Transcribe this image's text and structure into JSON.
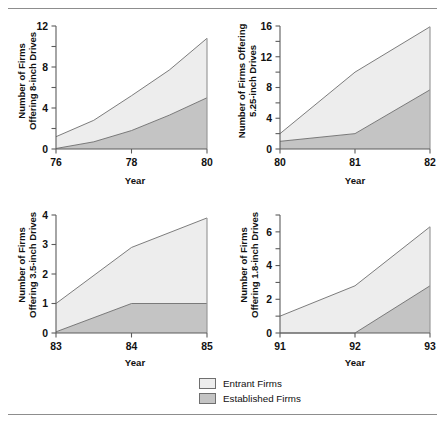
{
  "figure": {
    "background": "#ffffff",
    "rule_color": "#8d8d8d"
  },
  "legend": {
    "items": [
      {
        "label": "Entrant Firms",
        "color": "#ededed",
        "key": "entrant"
      },
      {
        "label": "Established Firms",
        "color": "#c4c4c4",
        "key": "established"
      }
    ]
  },
  "colors": {
    "entrant_fill": "#ededed",
    "established_fill": "#c4c4c4",
    "line": "#6e6e6e",
    "axis": "#5c5c5c",
    "text": "#111111"
  },
  "chart_data": [
    {
      "id": "panel-8-inch",
      "type": "area",
      "stacked": true,
      "title": "",
      "ylabel": "Number of Firms Offering 8-inch Drives",
      "ylabel_lines": [
        "Number of Firms",
        "Offering 8-inch Drives"
      ],
      "xlabel": "Year",
      "x": [
        76,
        77,
        78,
        79,
        80
      ],
      "xlim": [
        76,
        80
      ],
      "ylim": [
        0,
        12
      ],
      "xticks": [
        76,
        78,
        80
      ],
      "xticklabels": [
        "76",
        "78",
        "80"
      ],
      "yticks": [
        0,
        2,
        4,
        6,
        8,
        10,
        12
      ],
      "yticklabels": [
        "0",
        "",
        "4",
        "",
        "8",
        "",
        "12"
      ],
      "grid": false,
      "legend_position": "figure-bottom",
      "series": [
        {
          "name": "Established Firms",
          "key": "established",
          "values": [
            0.05,
            0.7,
            1.8,
            3.3,
            5.0
          ]
        },
        {
          "name": "Entrant Firms",
          "key": "entrant",
          "values": [
            1.15,
            2.1,
            3.4,
            4.4,
            5.8
          ]
        }
      ],
      "totals": [
        1.2,
        2.8,
        5.2,
        7.7,
        10.8
      ]
    },
    {
      "id": "panel-5-25-inch",
      "type": "area",
      "stacked": true,
      "title": "",
      "ylabel": "Number of Firms Offering 5.25-inch Drives",
      "ylabel_lines": [
        "Number of Firms Offering",
        "5.25-inch Drives"
      ],
      "xlabel": "Year",
      "x": [
        80,
        81,
        82
      ],
      "xlim": [
        80,
        82
      ],
      "ylim": [
        0,
        16
      ],
      "xticks": [
        80,
        81,
        82
      ],
      "xticklabels": [
        "80",
        "81",
        "82"
      ],
      "yticks": [
        0,
        2,
        4,
        6,
        8,
        10,
        12,
        14,
        16
      ],
      "yticklabels": [
        "0",
        "",
        "4",
        "",
        "8",
        "",
        "12",
        "",
        "16"
      ],
      "grid": false,
      "legend_position": "figure-bottom",
      "series": [
        {
          "name": "Established Firms",
          "key": "established",
          "values": [
            1.0,
            2.0,
            7.7
          ]
        },
        {
          "name": "Entrant Firms",
          "key": "entrant",
          "values": [
            1.0,
            8.0,
            8.2
          ]
        }
      ],
      "totals": [
        2.0,
        10.0,
        15.9
      ]
    },
    {
      "id": "panel-3-5-inch",
      "type": "area",
      "stacked": true,
      "title": "",
      "ylabel": "Number of Firms Offering 3.5-inch Drives",
      "ylabel_lines": [
        "Number of Firms",
        "Offering 3.5-inch Drives"
      ],
      "xlabel": "Year",
      "x": [
        83,
        84,
        85
      ],
      "xlim": [
        83,
        85
      ],
      "ylim": [
        0,
        4
      ],
      "xticks": [
        83,
        84,
        85
      ],
      "xticklabels": [
        "83",
        "84",
        "85"
      ],
      "yticks": [
        0,
        1,
        2,
        3,
        4
      ],
      "yticklabels": [
        "0",
        "1",
        "2",
        "3",
        "4"
      ],
      "grid": false,
      "legend_position": "figure-bottom",
      "series": [
        {
          "name": "Established Firms",
          "key": "established",
          "values": [
            0.04,
            1.0,
            1.0
          ]
        },
        {
          "name": "Entrant Firms",
          "key": "entrant",
          "values": [
            0.96,
            1.9,
            2.9
          ]
        }
      ],
      "totals": [
        1.0,
        2.9,
        3.9
      ]
    },
    {
      "id": "panel-1-8-inch",
      "type": "area",
      "stacked": true,
      "title": "",
      "ylabel": "Number of Firms Offering 1.8-inch Drives",
      "ylabel_lines": [
        "Number of Firms",
        "Offering 1.8-inch Drives"
      ],
      "xlabel": "Year",
      "x": [
        91,
        92,
        93
      ],
      "xlim": [
        91,
        93
      ],
      "ylim": [
        0,
        7
      ],
      "xticks": [
        91,
        92,
        93
      ],
      "xticklabels": [
        "91",
        "92",
        "93"
      ],
      "yticks": [
        0,
        1,
        2,
        3,
        4,
        5,
        6,
        7
      ],
      "yticklabels": [
        "0",
        "",
        "2",
        "",
        "4",
        "",
        "6",
        ""
      ],
      "grid": false,
      "legend_position": "figure-bottom",
      "series": [
        {
          "name": "Established Firms",
          "key": "established",
          "values": [
            0,
            0,
            2.8
          ]
        },
        {
          "name": "Entrant Firms",
          "key": "entrant",
          "values": [
            1.0,
            2.8,
            3.5
          ]
        }
      ],
      "totals": [
        1.0,
        2.8,
        6.3
      ]
    }
  ]
}
